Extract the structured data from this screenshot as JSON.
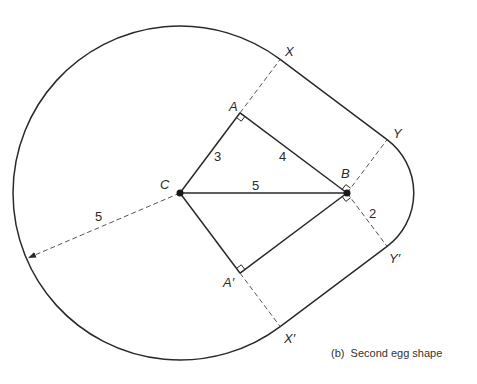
{
  "figure": {
    "caption": "(b)  Second egg shape",
    "points": {
      "C": "C",
      "A": "A",
      "B": "B",
      "A_prime": "A′",
      "X": "X",
      "Y": "Y",
      "Y_prime": "Y′",
      "X_prime": "X′"
    },
    "lengths": {
      "CA": "3",
      "AB": "4",
      "CB": "5",
      "B_to_Yprime": "2",
      "big_radius": "5"
    },
    "colors": {
      "ink": "#2a2a2a",
      "background": "#ffffff"
    }
  }
}
